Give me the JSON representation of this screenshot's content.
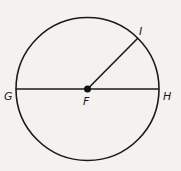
{
  "diagram": {
    "circle": {
      "cx": 87.5,
      "cy": 89,
      "r": 71.5,
      "stroke": "#1a1a1a"
    },
    "points": {
      "F": {
        "label": "F",
        "x": 87.5,
        "y": 89,
        "role": "center"
      },
      "G": {
        "label": "G",
        "x": 16,
        "y": 89
      },
      "H": {
        "label": "H",
        "x": 159,
        "y": 89
      },
      "I": {
        "label": "I",
        "x": 138,
        "y": 38
      }
    },
    "segments": [
      {
        "from": "G",
        "to": "H",
        "name": "diameter GH"
      },
      {
        "from": "F",
        "to": "I",
        "name": "radius FI"
      }
    ],
    "labels": {
      "G": "G",
      "H": "H",
      "F": "F",
      "I": "I"
    }
  }
}
